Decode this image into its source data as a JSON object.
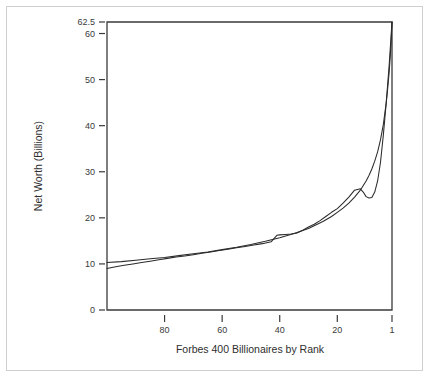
{
  "chart_data": {
    "type": "line",
    "title": "",
    "xlabel": "Forbes 400 Billionaires by Rank",
    "ylabel": "Net Worth (Billions)",
    "xlim": [
      100,
      1
    ],
    "ylim": [
      0,
      62.5
    ],
    "x_reversed": true,
    "grid": false,
    "legend": "none",
    "xticks": [
      80,
      60,
      40,
      20,
      1
    ],
    "xtick_labels": [
      "80",
      "60",
      "40",
      "20",
      "1"
    ],
    "yticks": [
      0,
      10,
      20,
      30,
      40,
      50,
      60,
      62.5
    ],
    "ytick_labels": [
      "0",
      "10",
      "20",
      "30",
      "40",
      "50",
      "60",
      "62.5"
    ],
    "series": [
      {
        "name": "Observed net worth by rank",
        "style": "jagged-step",
        "x": [
          100,
          97,
          94,
          91,
          88,
          85,
          82,
          79,
          76,
          73,
          70,
          67,
          64,
          61,
          58,
          55,
          52,
          49,
          46,
          43,
          41,
          40,
          38,
          36,
          34,
          32,
          30,
          28,
          26,
          24,
          22,
          20,
          18,
          16,
          14,
          12,
          11,
          10,
          9,
          8,
          7,
          6,
          5,
          4,
          3,
          2,
          1
        ],
        "y": [
          9.0,
          9.4,
          9.7,
          10.0,
          10.3,
          10.6,
          10.9,
          11.2,
          11.5,
          11.7,
          12.0,
          12.3,
          12.6,
          12.9,
          13.2,
          13.5,
          13.8,
          14.1,
          14.4,
          14.8,
          16.2,
          16.3,
          16.4,
          16.5,
          16.7,
          17.3,
          18.0,
          18.6,
          19.4,
          20.3,
          21.2,
          22.0,
          23.2,
          24.5,
          26.0,
          26.3,
          25.6,
          24.6,
          24.3,
          24.4,
          25.6,
          28.0,
          32.0,
          38.0,
          45.0,
          53.0,
          62.5
        ]
      },
      {
        "name": "Fitted power-law curve",
        "style": "smooth-fit",
        "x": [
          100,
          95,
          90,
          85,
          80,
          75,
          70,
          65,
          60,
          55,
          50,
          45,
          40,
          35,
          30,
          25,
          22,
          20,
          18,
          16,
          14,
          12,
          10,
          9,
          8,
          7,
          6,
          5,
          4,
          3,
          2.5,
          2,
          1.6,
          1.3,
          1.1,
          1
        ],
        "y": [
          10.3,
          10.5,
          10.8,
          11.1,
          11.4,
          11.8,
          12.2,
          12.6,
          13.1,
          13.6,
          14.2,
          14.9,
          15.7,
          16.6,
          17.7,
          19.2,
          20.3,
          21.2,
          22.1,
          23.2,
          24.5,
          26.0,
          28.0,
          29.2,
          30.6,
          32.3,
          34.3,
          36.9,
          40.3,
          45.0,
          48.0,
          51.5,
          55.0,
          58.3,
          61.0,
          62.5
        ]
      }
    ]
  },
  "figure": {
    "plot_area": {
      "left": 107,
      "top": 22,
      "right": 392,
      "bottom": 310
    }
  }
}
